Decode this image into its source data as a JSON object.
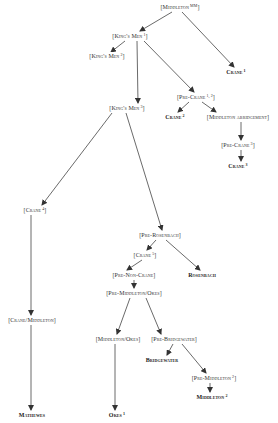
{
  "diagram": {
    "type": "stemma",
    "colors": {
      "line": "#444444",
      "text": "#333333",
      "background": "#ffffff"
    },
    "nodes": [
      {
        "id": "middleton_mm",
        "label": "[Middleton",
        "sup": "MM",
        "close": "]",
        "x": 180,
        "y": 7,
        "hypothetical": true
      },
      {
        "id": "kings_men_1",
        "label": "[King's Men",
        "sup": "1",
        "close": "]",
        "x": 130,
        "y": 36,
        "hypothetical": true
      },
      {
        "id": "kings_men_2",
        "label": "[King's Men",
        "sup": "2",
        "close": "]",
        "x": 107,
        "y": 56,
        "hypothetical": true
      },
      {
        "id": "crane_1",
        "label": "Crane",
        "sup": "1",
        "close": "",
        "x": 236,
        "y": 72,
        "hypothetical": false
      },
      {
        "id": "pre_crane_12",
        "label": "[Pre-Crane",
        "sup": "1, 2",
        "close": "]",
        "x": 196,
        "y": 97,
        "hypothetical": true
      },
      {
        "id": "kings_men_3",
        "label": "[King's Men",
        "sup": "3",
        "close": "]",
        "x": 127,
        "y": 108,
        "hypothetical": true
      },
      {
        "id": "crane_2",
        "label": "Crane",
        "sup": "2",
        "close": "",
        "x": 175,
        "y": 117,
        "hypothetical": false
      },
      {
        "id": "middleton_abridgement",
        "label": "[Middleton abridgement",
        "sup": "",
        "close": "]",
        "x": 238,
        "y": 117,
        "hypothetical": true
      },
      {
        "id": "pre_crane_3",
        "label": "[Pre-Crane",
        "sup": "3",
        "close": "]",
        "x": 238,
        "y": 145,
        "hypothetical": true
      },
      {
        "id": "crane_3",
        "label": "Crane",
        "sup": "3",
        "close": "",
        "x": 238,
        "y": 166,
        "hypothetical": false
      },
      {
        "id": "crane_4",
        "label": "[Crane",
        "sup": "4",
        "close": "]",
        "x": 35,
        "y": 210,
        "hypothetical": true
      },
      {
        "id": "pre_rosenbach",
        "label": "[Pre-Rosenbach",
        "sup": "",
        "close": "]",
        "x": 160,
        "y": 235,
        "hypothetical": true
      },
      {
        "id": "crane_5",
        "label": "[Crane",
        "sup": "5",
        "close": "]",
        "x": 145,
        "y": 255,
        "hypothetical": true
      },
      {
        "id": "pre_non_crane",
        "label": "[Pre-Non-Crane",
        "sup": "",
        "close": "]",
        "x": 134,
        "y": 275,
        "hypothetical": true
      },
      {
        "id": "rosenbach",
        "label": "Rosenbach",
        "sup": "",
        "close": "",
        "x": 202,
        "y": 275,
        "hypothetical": false
      },
      {
        "id": "pre_middleton_okes",
        "label": "[Pre-Middleton/Okes",
        "sup": "",
        "close": "]",
        "x": 134,
        "y": 293,
        "hypothetical": true
      },
      {
        "id": "crane_middleton",
        "label": "[Crane/Middleton",
        "sup": "",
        "close": "]",
        "x": 32,
        "y": 320,
        "hypothetical": true
      },
      {
        "id": "middleton_okes",
        "label": "[Middleton/Okes",
        "sup": "",
        "close": "]",
        "x": 118,
        "y": 339,
        "hypothetical": true
      },
      {
        "id": "pre_bridgewater",
        "label": "[Pre-Bridgewater",
        "sup": "",
        "close": "]",
        "x": 174,
        "y": 339,
        "hypothetical": true
      },
      {
        "id": "bridgewater",
        "label": "Bridgewater",
        "sup": "",
        "close": "",
        "x": 162,
        "y": 360,
        "hypothetical": false
      },
      {
        "id": "pre_middleton_2",
        "label": "[Pre-Middleton",
        "sup": "2",
        "close": "]",
        "x": 214,
        "y": 378,
        "hypothetical": true
      },
      {
        "id": "middleton_2",
        "label": "Middleton",
        "sup": "2",
        "close": "",
        "x": 212,
        "y": 397,
        "hypothetical": false
      },
      {
        "id": "mathewes",
        "label": "Mathewes",
        "sup": "",
        "close": "",
        "x": 32,
        "y": 415,
        "hypothetical": false
      },
      {
        "id": "okes_1",
        "label": "Okes",
        "sup": "1",
        "close": "",
        "x": 117,
        "y": 415,
        "hypothetical": false
      }
    ],
    "edges": [
      {
        "from": "middleton_mm",
        "to": "kings_men_1",
        "x1": 172,
        "y1": 12,
        "x2": 140,
        "y2": 31
      },
      {
        "from": "middleton_mm",
        "to": "crane_1",
        "x1": 182,
        "y1": 12,
        "x2": 234,
        "y2": 67
      },
      {
        "from": "kings_men_1",
        "to": "kings_men_2",
        "x1": 125,
        "y1": 41,
        "x2": 111,
        "y2": 52
      },
      {
        "from": "kings_men_1",
        "to": "kings_men_3",
        "x1": 137,
        "y1": 41,
        "x2": 138,
        "y2": 103
      },
      {
        "from": "kings_men_1",
        "to": "pre_crane_12",
        "x1": 144,
        "y1": 41,
        "x2": 194,
        "y2": 92
      },
      {
        "from": "pre_crane_12",
        "to": "crane_2",
        "x1": 189,
        "y1": 102,
        "x2": 178,
        "y2": 112
      },
      {
        "from": "pre_crane_12",
        "to": "middleton_abridgement",
        "x1": 202,
        "y1": 102,
        "x2": 216,
        "y2": 112
      },
      {
        "from": "middleton_abridgement",
        "to": "pre_crane_3",
        "x1": 241,
        "y1": 122,
        "x2": 241,
        "y2": 140
      },
      {
        "from": "pre_crane_3",
        "to": "crane_3",
        "x1": 241,
        "y1": 150,
        "x2": 241,
        "y2": 161
      },
      {
        "from": "kings_men_3",
        "to": "crane_4",
        "x1": 112,
        "y1": 113,
        "x2": 42,
        "y2": 205
      },
      {
        "from": "kings_men_3",
        "to": "pre_rosenbach",
        "x1": 126,
        "y1": 113,
        "x2": 162,
        "y2": 230
      },
      {
        "from": "pre_rosenbach",
        "to": "crane_5",
        "x1": 156,
        "y1": 240,
        "x2": 147,
        "y2": 250
      },
      {
        "from": "pre_rosenbach",
        "to": "rosenbach",
        "x1": 166,
        "y1": 240,
        "x2": 200,
        "y2": 270
      },
      {
        "from": "crane_5",
        "to": "pre_non_crane",
        "x1": 142,
        "y1": 260,
        "x2": 127,
        "y2": 270
      },
      {
        "from": "pre_non_crane",
        "to": "pre_middleton_okes",
        "x1": 134,
        "y1": 280,
        "x2": 134,
        "y2": 288
      },
      {
        "from": "pre_middleton_okes",
        "to": "middleton_okes",
        "x1": 130,
        "y1": 298,
        "x2": 117,
        "y2": 334
      },
      {
        "from": "pre_middleton_okes",
        "to": "pre_bridgewater",
        "x1": 146,
        "y1": 298,
        "x2": 161,
        "y2": 334
      },
      {
        "from": "crane_4",
        "to": "crane_middleton",
        "x1": 31,
        "y1": 215,
        "x2": 31,
        "y2": 315
      },
      {
        "from": "pre_bridgewater",
        "to": "bridgewater",
        "x1": 173,
        "y1": 344,
        "x2": 167,
        "y2": 355
      },
      {
        "from": "pre_bridgewater",
        "to": "pre_middleton_2",
        "x1": 182,
        "y1": 344,
        "x2": 206,
        "y2": 373
      },
      {
        "from": "pre_middleton_2",
        "to": "middleton_2",
        "x1": 210,
        "y1": 383,
        "x2": 210,
        "y2": 392
      },
      {
        "from": "crane_middleton",
        "to": "mathewes",
        "x1": 31,
        "y1": 325,
        "x2": 31,
        "y2": 410
      },
      {
        "from": "middleton_okes",
        "to": "okes_1",
        "x1": 115,
        "y1": 344,
        "x2": 115,
        "y2": 410
      }
    ]
  }
}
